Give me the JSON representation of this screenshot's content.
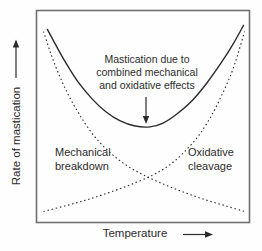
{
  "figure": {
    "background": "#fefefe",
    "ink_color": "#2b2b2b",
    "box_color": "#6f6f6f"
  },
  "labels": {
    "annotation": "Mastication due to\ncombined mechanical\nand oxidative effects",
    "mechanical": "Mechanical\nbreakdown",
    "oxidative": "Oxidative\ncleavage",
    "xlabel": "Temperature",
    "ylabel": "Rate of mastication"
  },
  "chart_data": {
    "type": "line",
    "title": "",
    "xlabel": "Temperature",
    "ylabel": "Rate of mastication",
    "x_axis": {
      "qualitative": true,
      "range": [
        0,
        1
      ],
      "ticks": "none",
      "arrow": "right"
    },
    "y_axis": {
      "qualitative": true,
      "range": [
        0,
        1
      ],
      "ticks": "none",
      "arrow": "up"
    },
    "grid": false,
    "legend": "none (curves labeled inline)",
    "annotation": {
      "text": "Mastication due to combined mechanical and oxidative effects",
      "arrow": "points down to minimum of solid curve",
      "target": {
        "x": 0.52,
        "y": 0.46
      }
    },
    "series": [
      {
        "name": "Mastication due to combined mechanical and oxidative effects",
        "style": "solid",
        "shape": "U-curve (sum of the two dotted curves), minimum near mid-temperature",
        "x": [
          0.051,
          0.089,
          0.136,
          0.196,
          0.262,
          0.327,
          0.393,
          0.463,
          0.533,
          0.594,
          0.659,
          0.729,
          0.799,
          0.869,
          0.925,
          0.972
        ],
        "y": [
          0.911,
          0.84,
          0.756,
          0.662,
          0.582,
          0.521,
          0.479,
          0.455,
          0.451,
          0.469,
          0.512,
          0.573,
          0.657,
          0.756,
          0.845,
          0.93
        ]
      },
      {
        "name": "Mechanical breakdown",
        "style": "dotted",
        "shape": "monotonically decreasing, steep at low temperature",
        "x": [
          0.033,
          0.065,
          0.103,
          0.15,
          0.206,
          0.271,
          0.346,
          0.425,
          0.509,
          0.603,
          0.696,
          0.79,
          0.883,
          0.977
        ],
        "y": [
          0.901,
          0.803,
          0.704,
          0.601,
          0.502,
          0.408,
          0.329,
          0.268,
          0.221,
          0.178,
          0.141,
          0.108,
          0.08,
          0.052
        ]
      },
      {
        "name": "Oxidative cleavage",
        "style": "dotted",
        "shape": "monotonically increasing, steep at high temperature; crosses mechanical-breakdown curve mid-plot",
        "x": [
          0.033,
          0.14,
          0.24,
          0.34,
          0.44,
          0.54,
          0.62,
          0.69,
          0.76,
          0.82,
          0.87,
          0.915,
          0.948,
          0.977
        ],
        "y": [
          0.052,
          0.08,
          0.108,
          0.141,
          0.178,
          0.221,
          0.268,
          0.329,
          0.408,
          0.502,
          0.601,
          0.704,
          0.803,
          0.901
        ]
      }
    ]
  }
}
